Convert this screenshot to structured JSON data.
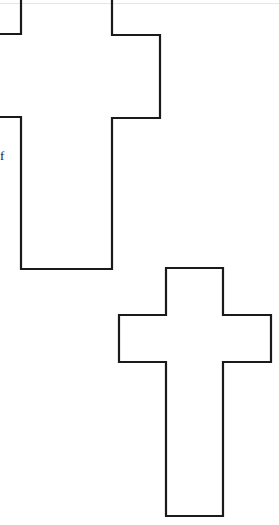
{
  "page": {
    "text_fragment": "f",
    "line_color": "#1a1a1a"
  },
  "shapes": [
    {
      "name": "upper-cross",
      "kind": "cross-outline",
      "clipped": true
    },
    {
      "name": "lower-cross",
      "kind": "cross-outline",
      "clipped": false
    }
  ]
}
